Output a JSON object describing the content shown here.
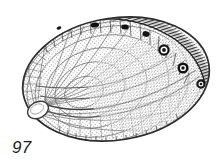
{
  "plate": {
    "width": 221,
    "height": 166,
    "background_color": "#ffffff",
    "ink_color": "#2b2b2b",
    "caption_color": "#1a1a1a"
  },
  "figure": {
    "number_label": "97",
    "technique": "stipple-and-line-engraving",
    "orientation": "apex-lower-left, pore-row-upper-right"
  },
  "illustration": {
    "outline": {
      "name": "shell-outline",
      "shape": "broad-oval",
      "center_x": 116,
      "center_y": 79,
      "radius_x": 94,
      "radius_y": 61,
      "rotation_deg": -9,
      "stroke_color": "#333333",
      "stroke_width": 1.6
    },
    "margin_band": {
      "name": "spiral-margin-band",
      "description": "dark hatched band along upper and right margin",
      "color": "#262626",
      "hatch_count": 58
    },
    "apex_scar": {
      "name": "apex-muscle-scar",
      "cx": 38,
      "cy": 110,
      "rx": 11,
      "ry": 8,
      "rotation_deg": -28,
      "fill": "#ffffff",
      "stroke": "#3a3a3a"
    },
    "pores": [
      {
        "id": 1,
        "cx": 59,
        "cy": 28,
        "r": 2.0,
        "open": false
      },
      {
        "id": 2,
        "cx": 95,
        "cy": 25,
        "r": 3.4,
        "open": false
      },
      {
        "id": 3,
        "cx": 125,
        "cy": 27,
        "r": 3.2,
        "open": false
      },
      {
        "id": 4,
        "cx": 146,
        "cy": 33,
        "r": 3.3,
        "open": false
      },
      {
        "id": 5,
        "cx": 164,
        "cy": 50,
        "r": 4.4,
        "open": true
      },
      {
        "id": 6,
        "cx": 183,
        "cy": 68,
        "r": 4.2,
        "open": true
      },
      {
        "id": 7,
        "cx": 201,
        "cy": 84,
        "r": 3.6,
        "open": true
      }
    ],
    "pore_count": 7,
    "radial_ribs": 34,
    "growth_lines": 9,
    "stipple_density": "fine"
  }
}
